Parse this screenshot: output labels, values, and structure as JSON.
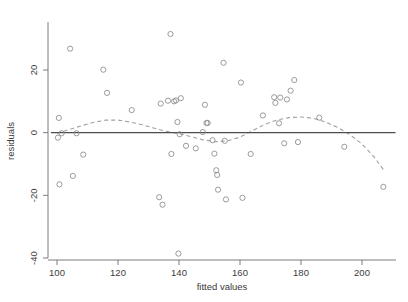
{
  "chart_data": {
    "type": "scatter",
    "title": "",
    "subtitle": "",
    "xlabel": "fitted values",
    "ylabel": "residuals",
    "xlim": [
      96,
      212
    ],
    "ylim": [
      -42,
      34
    ],
    "xticks": [
      100,
      120,
      140,
      160,
      180,
      200
    ],
    "yticks": [
      20,
      0,
      -20,
      -40
    ],
    "grid": false,
    "legend": null,
    "marker": "open-circle",
    "point_color": "#8a8a8a",
    "reference_line": {
      "name": "zero-line",
      "style": "solid",
      "color": "#4d4d4d",
      "y": 0
    },
    "smoother": {
      "name": "loess-smoother",
      "style": "dashed",
      "color": "#a0a0a0",
      "x": [
        100,
        104,
        108,
        112,
        116,
        120,
        124,
        128,
        132,
        136,
        140,
        144,
        148,
        152,
        156,
        160,
        164,
        168,
        172,
        176,
        180,
        184,
        188,
        192,
        196,
        200,
        204,
        207
      ],
      "y": [
        -0.2,
        1.0,
        2.2,
        3.3,
        4.0,
        4.0,
        3.4,
        2.5,
        1.4,
        0.4,
        -0.3,
        -1.3,
        -2.3,
        -2.9,
        -2.6,
        -1.4,
        0.6,
        2.6,
        4.0,
        4.8,
        5.0,
        4.6,
        3.4,
        1.7,
        -0.6,
        -3.6,
        -7.8,
        -11.8
      ]
    },
    "points": [
      {
        "x": 100.3,
        "y": -1.6
      },
      {
        "x": 100.6,
        "y": 4.7
      },
      {
        "x": 100.8,
        "y": -16.5
      },
      {
        "x": 101.5,
        "y": -0.2
      },
      {
        "x": 104.3,
        "y": 26.8
      },
      {
        "x": 105.2,
        "y": -13.8
      },
      {
        "x": 106.4,
        "y": -0.2
      },
      {
        "x": 108.6,
        "y": -7.0
      },
      {
        "x": 115.2,
        "y": 20.1
      },
      {
        "x": 116.4,
        "y": 12.7
      },
      {
        "x": 124.5,
        "y": 7.2
      },
      {
        "x": 133.5,
        "y": -20.6
      },
      {
        "x": 134.0,
        "y": 9.3
      },
      {
        "x": 134.6,
        "y": -23.0
      },
      {
        "x": 136.4,
        "y": 10.2
      },
      {
        "x": 137.2,
        "y": 31.5
      },
      {
        "x": 137.5,
        "y": -6.8
      },
      {
        "x": 138.4,
        "y": 10.0
      },
      {
        "x": 139.0,
        "y": 10.3
      },
      {
        "x": 139.5,
        "y": 3.4
      },
      {
        "x": 139.8,
        "y": -38.6
      },
      {
        "x": 140.2,
        "y": -0.5
      },
      {
        "x": 140.6,
        "y": 11.0
      },
      {
        "x": 142.3,
        "y": -4.2
      },
      {
        "x": 145.5,
        "y": -5.0
      },
      {
        "x": 147.8,
        "y": 0.2
      },
      {
        "x": 148.5,
        "y": 8.9
      },
      {
        "x": 149.0,
        "y": 3.1
      },
      {
        "x": 149.4,
        "y": 3.1
      },
      {
        "x": 151.0,
        "y": -2.4
      },
      {
        "x": 151.6,
        "y": -6.7
      },
      {
        "x": 152.2,
        "y": -12.0
      },
      {
        "x": 152.5,
        "y": -13.5
      },
      {
        "x": 152.8,
        "y": -18.2
      },
      {
        "x": 154.6,
        "y": 22.3
      },
      {
        "x": 155.0,
        "y": -2.6
      },
      {
        "x": 155.4,
        "y": -21.3
      },
      {
        "x": 160.3,
        "y": 16.0
      },
      {
        "x": 160.8,
        "y": -20.8
      },
      {
        "x": 163.5,
        "y": -6.8
      },
      {
        "x": 167.5,
        "y": 5.5
      },
      {
        "x": 171.2,
        "y": 11.3
      },
      {
        "x": 171.6,
        "y": 9.5
      },
      {
        "x": 172.8,
        "y": 3.0
      },
      {
        "x": 173.2,
        "y": 11.2
      },
      {
        "x": 174.5,
        "y": -3.4
      },
      {
        "x": 175.4,
        "y": 10.6
      },
      {
        "x": 176.6,
        "y": 13.4
      },
      {
        "x": 177.8,
        "y": 16.8
      },
      {
        "x": 179.0,
        "y": -3.0
      },
      {
        "x": 186.0,
        "y": 4.8
      },
      {
        "x": 194.2,
        "y": -4.5
      },
      {
        "x": 207.0,
        "y": -17.3
      }
    ]
  }
}
